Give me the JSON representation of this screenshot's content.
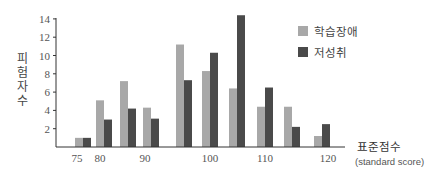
{
  "chart_data": {
    "type": "bar",
    "title": "",
    "xlabel": "표준점수",
    "xlabel_sub": "(standard score)",
    "ylabel": "피험자 수",
    "ylabel_chars": [
      "피",
      "험",
      "자",
      "수"
    ],
    "ylim": [
      0,
      14
    ],
    "yticks": [
      2,
      4,
      6,
      8,
      10,
      12,
      14
    ],
    "x": [
      75,
      80,
      85,
      90,
      95,
      100,
      105,
      110,
      115,
      120
    ],
    "xtick_labels": [
      {
        "x": 75,
        "label": "75"
      },
      {
        "x": 80,
        "label": "80"
      },
      {
        "x": 90,
        "label": "90"
      },
      {
        "x": 100,
        "label": "100"
      },
      {
        "x": 110,
        "label": "110"
      },
      {
        "x": 120,
        "label": "120"
      }
    ],
    "series": [
      {
        "name": "학습장애",
        "color": "#a8a8a8",
        "values": [
          1,
          5.1,
          7.2,
          4.3,
          11.2,
          8.3,
          6.4,
          4.4,
          4.4,
          1.2
        ]
      },
      {
        "name": "저성취",
        "color": "#4a4a4a",
        "values": [
          1,
          3,
          4.2,
          3.1,
          7.3,
          10.3,
          14.4,
          6.5,
          2.2,
          2.5
        ]
      }
    ],
    "grid": false,
    "legend_position": "upper right"
  }
}
